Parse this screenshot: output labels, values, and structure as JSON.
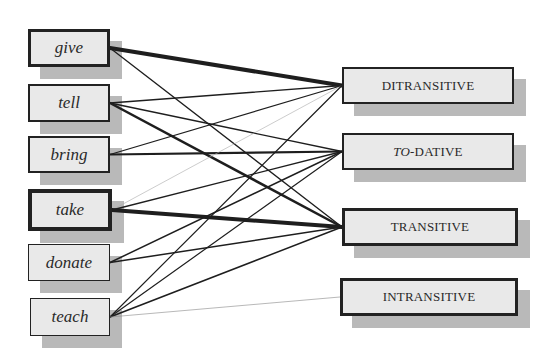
{
  "diagram": {
    "verbs": [
      {
        "id": "give",
        "label": "give",
        "border": 3,
        "x": 28,
        "y": 29,
        "w": 82,
        "h": 38
      },
      {
        "id": "tell",
        "label": "tell",
        "border": 2,
        "x": 28,
        "y": 84,
        "w": 82,
        "h": 38
      },
      {
        "id": "bring",
        "label": "bring",
        "border": 2,
        "x": 28,
        "y": 136,
        "w": 82,
        "h": 37
      },
      {
        "id": "take",
        "label": "take",
        "border": 4,
        "x": 28,
        "y": 189,
        "w": 84,
        "h": 42
      },
      {
        "id": "donate",
        "label": "donate",
        "border": 1,
        "x": 28,
        "y": 244,
        "w": 82,
        "h": 37
      },
      {
        "id": "teach",
        "label": "teach",
        "border": 1.5,
        "x": 30,
        "y": 298,
        "w": 80,
        "h": 38
      }
    ],
    "frames": [
      {
        "id": "ditransitive",
        "label": "DITRANSITIVE",
        "border": 2,
        "x": 342,
        "y": 67,
        "w": 172,
        "h": 37
      },
      {
        "id": "to-dative",
        "label_italic": "TO",
        "label_rest": "-DATIVE",
        "border": 2,
        "x": 342,
        "y": 133,
        "w": 172,
        "h": 37
      },
      {
        "id": "transitive",
        "label": "TRANSITIVE",
        "border": 3,
        "x": 342,
        "y": 208,
        "w": 176,
        "h": 38
      },
      {
        "id": "intransitive",
        "label": "INTRANSITIVE",
        "border": 3,
        "x": 340,
        "y": 278,
        "w": 178,
        "h": 38
      }
    ],
    "links": [
      {
        "from": "give",
        "to": "ditransitive",
        "weight": 4
      },
      {
        "from": "give",
        "to": "transitive",
        "weight": 1.3
      },
      {
        "from": "tell",
        "to": "ditransitive",
        "weight": 1.3
      },
      {
        "from": "tell",
        "to": "to-dative",
        "weight": 1.3
      },
      {
        "from": "tell",
        "to": "transitive",
        "weight": 2.5
      },
      {
        "from": "bring",
        "to": "ditransitive",
        "weight": 1.3
      },
      {
        "from": "bring",
        "to": "to-dative",
        "weight": 2.2
      },
      {
        "from": "take",
        "to": "ditransitive",
        "weight": 0.6,
        "color": "#aaaaaa"
      },
      {
        "from": "take",
        "to": "to-dative",
        "weight": 1.3
      },
      {
        "from": "take",
        "to": "transitive",
        "weight": 4
      },
      {
        "from": "donate",
        "to": "to-dative",
        "weight": 1.5
      },
      {
        "from": "donate",
        "to": "transitive",
        "weight": 1.5
      },
      {
        "from": "teach",
        "to": "ditransitive",
        "weight": 1.2
      },
      {
        "from": "teach",
        "to": "to-dative",
        "weight": 1.2
      },
      {
        "from": "teach",
        "to": "transitive",
        "weight": 1.5
      },
      {
        "from": "teach",
        "to": "intransitive",
        "weight": 0.6,
        "color": "#888888"
      }
    ],
    "colors": {
      "box_fill": "#e9e9e9",
      "box_border": "#222222",
      "shadow": "#b9b9b9",
      "link": "#1e1e1e"
    }
  }
}
